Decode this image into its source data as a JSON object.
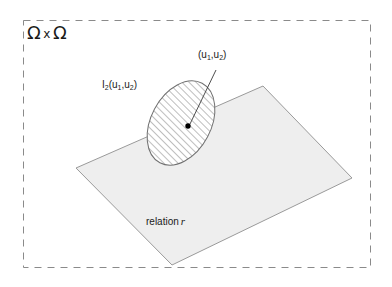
{
  "figure": {
    "title_label": "Ω x Ω",
    "universe_symbol": "Ω",
    "times_symbol": "x",
    "background_color": "#ffffff",
    "frame": {
      "name": "outer-dashed-frame",
      "style": "dashed",
      "color": "#8a8a8a",
      "x": 23,
      "y": 20,
      "width": 348,
      "height": 248
    },
    "plane": {
      "label_prefix": "relation",
      "label_symbol": "r",
      "fill_color": "#eeeeee",
      "stroke_color": "#9a9a9a",
      "corners": [
        {
          "x": 263,
          "y": 86
        },
        {
          "x": 352,
          "y": 178
        },
        {
          "x": 172,
          "y": 265
        },
        {
          "x": 76,
          "y": 168
        }
      ]
    },
    "region": {
      "label": "I",
      "label_subscript": "2",
      "label_args": "(u",
      "label_arg1_sub": "1",
      "label_sep": ",u",
      "label_arg2_sub": "2",
      "label_close": ")",
      "hatch_color": "#6e6e6e",
      "stroke_color": "#707070",
      "center_x": 181,
      "center_y": 123,
      "radius_x": 30,
      "radius_y": 45,
      "rotation_deg": 28
    },
    "point": {
      "label_open": "(u",
      "label_sub1": "1",
      "label_sep": ",u",
      "label_sub2": "2",
      "label_close": ")",
      "marker_color": "#000000",
      "x": 188,
      "y": 126,
      "leader_from_x": 216,
      "leader_from_y": 70,
      "leader_to_x": 190,
      "leader_to_y": 124
    }
  }
}
